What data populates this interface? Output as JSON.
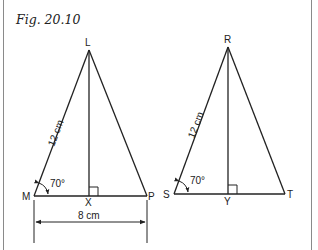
{
  "figure": {
    "title": "Fig. 20.10"
  },
  "triangle_1": {
    "vertices": {
      "apex": "L",
      "left": "M",
      "foot": "X",
      "right": "P"
    },
    "side_label": "12 cm",
    "angle_label": "70°",
    "base_dimension": "8 cm"
  },
  "triangle_2": {
    "vertices": {
      "apex": "R",
      "left": "S",
      "foot": "Y",
      "right": "T"
    },
    "side_label": "12 cm",
    "angle_label": "70°"
  },
  "colors": {
    "line": "#222222",
    "frame": "#8a8a8a"
  }
}
